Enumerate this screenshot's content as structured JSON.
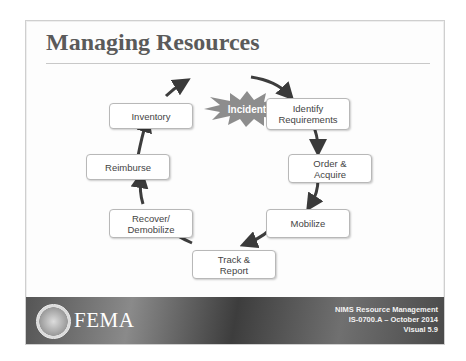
{
  "slide": {
    "title": "Managing Resources",
    "diagram": {
      "center": "Incident",
      "steps": [
        {
          "label": "Identify Requirements",
          "line1": "Identify",
          "line2": "Requirements"
        },
        {
          "label": "Order & Acquire",
          "line1": "Order &",
          "line2": "Acquire"
        },
        {
          "label": "Mobilize",
          "line1": "Mobilize",
          "line2": ""
        },
        {
          "label": "Track & Report",
          "line1": "Track &",
          "line2": "Report"
        },
        {
          "label": "Recover/ Demobilize",
          "line1": "Recover/",
          "line2": "Demobilize"
        },
        {
          "label": "Reimburse",
          "line1": "Reimburse",
          "line2": ""
        },
        {
          "label": "Inventory",
          "line1": "Inventory",
          "line2": ""
        }
      ]
    },
    "footer": {
      "logo_text": "FEMA",
      "line1": "NIMS Resource Management",
      "line2": "IS-0700.A – October 2014",
      "line3": "Visual 5.9"
    }
  }
}
